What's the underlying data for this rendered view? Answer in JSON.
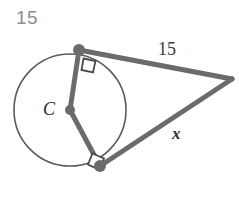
{
  "figure": {
    "background_color": "#ffffff",
    "stroke_color": "#6b6b6b",
    "circle_stroke_color": "#5a5a5a",
    "marker_color": "#6b6b6b",
    "right_angle_color": "#4a4a4a"
  },
  "labels": {
    "problem_number": "15",
    "tangent_length": "15",
    "unknown_length": "x",
    "center_point": "C"
  },
  "geometry": {
    "circle": {
      "center_x": 70,
      "center_y": 110,
      "radius": 56,
      "stroke_width": 1.6
    },
    "center_dot": {
      "x": 70,
      "y": 110,
      "r": 5
    },
    "upper_tangent_point": {
      "x": 79,
      "y": 50,
      "r": 6
    },
    "lower_tangent_point": {
      "x": 100,
      "y": 166,
      "r": 6
    },
    "apex_point": {
      "x": 232,
      "y": 79
    },
    "segments": [
      {
        "name": "radius-to-upper-tangent",
        "x1": 70,
        "y1": 110,
        "x2": 79,
        "y2": 50
      },
      {
        "name": "radius-to-lower-tangent",
        "x1": 70,
        "y1": 110,
        "x2": 100,
        "y2": 166
      },
      {
        "name": "upper-tangent-segment",
        "x1": 79,
        "y1": 50,
        "x2": 232,
        "y2": 79
      },
      {
        "name": "lower-tangent-segment",
        "x1": 100,
        "y1": 166,
        "x2": 232,
        "y2": 79
      }
    ],
    "right_angle_markers": [
      {
        "name": "upper-right-angle",
        "points": "83.5,58.5 95.5,61.0 93.0,72.5 81.5,70.0"
      },
      {
        "name": "lower-right-angle",
        "points": "92.5,153.5 104.0,158.5 99.0,169.5 88.0,164.5"
      }
    ],
    "line_width": 5
  }
}
